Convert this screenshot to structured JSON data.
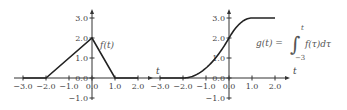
{
  "chart_data": [
    {
      "type": "line",
      "title": "",
      "xlabel": "t",
      "ylabel": "",
      "annotation": "f(t)",
      "xlim": [
        -3.0,
        2.0
      ],
      "ylim": [
        -1.0,
        3.0
      ],
      "xticks": [
        -3.0,
        -2.0,
        -1.0,
        0.0,
        1.0,
        2.0
      ],
      "xtick_labels": [
        "−3.0",
        "−2.0",
        "−1.0",
        "0.0",
        "1.0",
        "2.0"
      ],
      "yticks": [
        -1.0,
        0.0,
        1.0,
        2.0,
        3.0
      ],
      "ytick_labels": [
        "−1.0",
        "0.0",
        "1.0",
        "2.0",
        "3.0"
      ],
      "grid": false,
      "series": [
        {
          "name": "f(t)",
          "x": [
            -3.0,
            -2.0,
            0.0,
            1.0,
            2.0
          ],
          "y": [
            0.0,
            0.0,
            2.0,
            0.0,
            0.0
          ]
        }
      ]
    },
    {
      "type": "line",
      "title": "",
      "xlabel": "t",
      "ylabel": "",
      "annotation": {
        "lhs": "g(t) =",
        "integral_symbol": "∫",
        "upper_limit": "t",
        "lower_limit": "−3",
        "integrand": "f(τ)dτ"
      },
      "xlim": [
        -3.0,
        2.0
      ],
      "ylim": [
        -1.0,
        3.0
      ],
      "xticks": [
        -3.0,
        -2.0,
        -1.0,
        0.0,
        1.0,
        2.0
      ],
      "xtick_labels": [
        "−3.0",
        "−2.0",
        "−1.0",
        "0.0",
        "1.0",
        "2.0"
      ],
      "yticks": [
        -1.0,
        0.0,
        1.0,
        2.0,
        3.0
      ],
      "ytick_labels": [
        "−1.0",
        "0.0",
        "1.0",
        "2.0",
        "3.0"
      ],
      "grid": false,
      "series": [
        {
          "name": "g(t)",
          "x": [
            -3.0,
            -2.0,
            -1.5,
            -1.0,
            -0.5,
            0.0,
            0.5,
            1.0,
            2.0
          ],
          "y": [
            0.0,
            0.0,
            0.125,
            0.5,
            1.125,
            2.0,
            2.75,
            3.0,
            3.0
          ]
        }
      ]
    }
  ]
}
